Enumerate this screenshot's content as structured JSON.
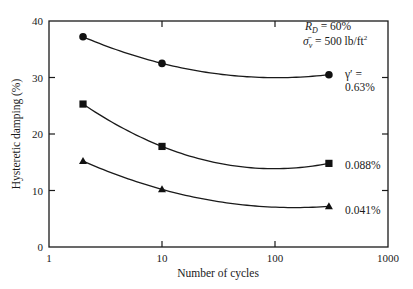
{
  "chart_data": {
    "type": "line",
    "title": "",
    "xlabel": "Number of cycles",
    "ylabel": "Hysteretic damping (%)",
    "xscale": "log",
    "xlim": [
      1,
      1000
    ],
    "ylim": [
      0,
      40
    ],
    "grid": false,
    "x_ticks": [
      1,
      10,
      100,
      1000
    ],
    "x_tick_labels": [
      "1",
      "10",
      "100",
      "1000"
    ],
    "y_ticks": [
      0,
      10,
      20,
      30,
      40
    ],
    "y_tick_labels": [
      "0",
      "10",
      "20",
      "30",
      "40"
    ],
    "series": [
      {
        "name": "γ' = 0.63%",
        "marker": "circle",
        "x": [
          2,
          10,
          300
        ],
        "values": [
          37.2,
          32.5,
          30.5
        ]
      },
      {
        "name": "0.088%",
        "marker": "square",
        "x": [
          2,
          10,
          300
        ],
        "values": [
          25.3,
          17.8,
          14.8
        ]
      },
      {
        "name": "0.041%",
        "marker": "triangle",
        "x": [
          2,
          10,
          300
        ],
        "values": [
          15.2,
          10.2,
          7.2
        ]
      }
    ],
    "annotations": {
      "conditions_line1": "R_D = 60%",
      "conditions_line2": "σ̄_v = 500 lb/ft²",
      "gamma_label": "γ′ =",
      "label_063": "0.63%",
      "label_0088": "0.088%",
      "label_0041": "0.041%"
    },
    "legend": "inline-right"
  }
}
